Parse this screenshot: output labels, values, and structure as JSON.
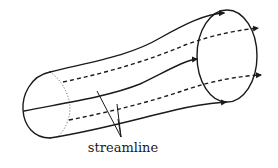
{
  "diagram": {
    "label": "streamline",
    "colors": {
      "stroke": "#1a1a1a",
      "background": "#ffffff"
    }
  }
}
